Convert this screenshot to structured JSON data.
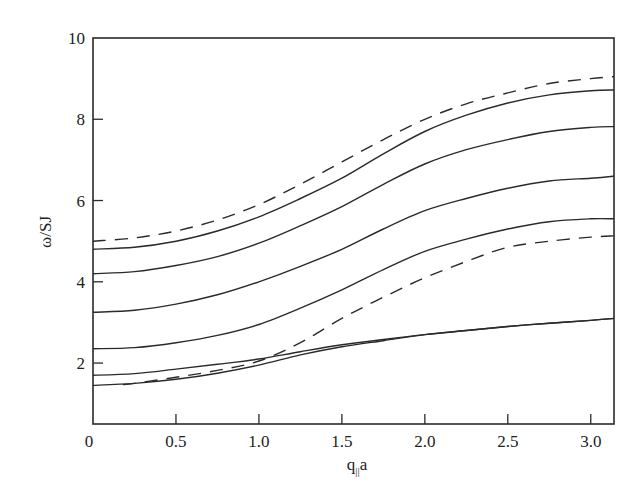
{
  "chart_data": {
    "type": "line",
    "title": "",
    "xlabel": "q||a",
    "xlabel_main": "q",
    "xlabel_sub": "||",
    "xlabel_tail": "a",
    "ylabel": "ω/SJ",
    "xlim": [
      0,
      3.14
    ],
    "ylim": [
      0.5,
      10
    ],
    "grid": false,
    "legend": null,
    "x_ticks": [
      {
        "value": 0,
        "label": "0"
      },
      {
        "value": 0.5,
        "label": "0.5"
      },
      {
        "value": 1.0,
        "label": "1.0"
      },
      {
        "value": 1.5,
        "label": "1.5"
      },
      {
        "value": 2.0,
        "label": "2.0"
      },
      {
        "value": 2.5,
        "label": "2.5"
      },
      {
        "value": 3.0,
        "label": "3.0"
      }
    ],
    "y_ticks": [
      {
        "value": 2,
        "label": "2"
      },
      {
        "value": 4,
        "label": "4"
      },
      {
        "value": 6,
        "label": "6"
      },
      {
        "value": 8,
        "label": "8"
      },
      {
        "value": 10,
        "label": "10"
      }
    ],
    "x": [
      0,
      0.25,
      0.5,
      0.75,
      1.0,
      1.25,
      1.5,
      1.75,
      2.0,
      2.25,
      2.5,
      2.75,
      3.0,
      3.14
    ],
    "series": [
      {
        "name": "upper bulk band edge",
        "style": "dashed",
        "values": [
          5.0,
          5.08,
          5.25,
          5.52,
          5.9,
          6.4,
          6.95,
          7.5,
          8.0,
          8.38,
          8.65,
          8.88,
          9.0,
          9.05
        ]
      },
      {
        "name": "surface mode 1",
        "style": "solid",
        "values": [
          4.8,
          4.85,
          5.0,
          5.25,
          5.6,
          6.05,
          6.55,
          7.15,
          7.7,
          8.1,
          8.4,
          8.6,
          8.7,
          8.72
        ]
      },
      {
        "name": "surface mode 2",
        "style": "solid",
        "values": [
          4.2,
          4.25,
          4.4,
          4.62,
          4.95,
          5.38,
          5.85,
          6.4,
          6.9,
          7.25,
          7.5,
          7.7,
          7.8,
          7.82
        ]
      },
      {
        "name": "surface mode 3",
        "style": "solid",
        "values": [
          3.25,
          3.3,
          3.45,
          3.68,
          4.0,
          4.38,
          4.8,
          5.3,
          5.75,
          6.05,
          6.3,
          6.48,
          6.55,
          6.6
        ]
      },
      {
        "name": "surface mode 4",
        "style": "solid",
        "values": [
          2.35,
          2.38,
          2.5,
          2.68,
          2.95,
          3.35,
          3.8,
          4.3,
          4.75,
          5.05,
          5.3,
          5.48,
          5.55,
          5.55
        ]
      },
      {
        "name": "lower bulk band edge",
        "style": "dashed",
        "values": [
          null,
          1.5,
          1.65,
          1.82,
          2.05,
          2.5,
          3.1,
          3.62,
          4.1,
          4.5,
          4.85,
          5.0,
          5.1,
          5.13
        ]
      },
      {
        "name": "surface mode 5",
        "style": "solid",
        "values": [
          1.7,
          1.74,
          1.85,
          1.97,
          2.1,
          2.28,
          2.45,
          2.58,
          2.7,
          2.8,
          2.9,
          2.98,
          3.05,
          3.1
        ]
      },
      {
        "name": "surface mode 6",
        "style": "solid",
        "values": [
          1.45,
          1.5,
          1.6,
          1.75,
          1.95,
          2.2,
          2.4,
          2.55,
          2.7,
          2.8,
          2.9,
          2.98,
          3.05,
          3.1
        ]
      }
    ]
  }
}
